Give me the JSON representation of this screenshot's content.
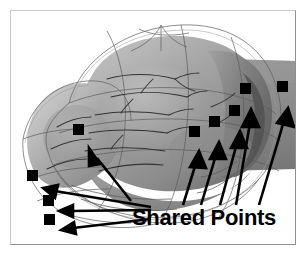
{
  "figure": {
    "kind": "scientific-illustration",
    "background_color": "#ffffff",
    "frame_color": "#c9c9c9",
    "frame_shadow_color": "#8f8f8f",
    "annotation_color": "#000000",
    "surface_colors": {
      "organ_light": "#b9b9b9",
      "organ_mid": "#9a9a9a",
      "organ_dark": "#7c7c7c",
      "organ_darkest": "#5d5d5d",
      "mesh_wireframe": "#4a4a4a",
      "mesh_outline": "#8a8a8a",
      "vessel": "#3c3c3c"
    },
    "caption": {
      "shared_points_label": "Shared Points"
    },
    "markers": {
      "count": 8,
      "shape": "filled-square",
      "color": "#000000",
      "size_px": 11,
      "points": [
        {
          "id": "shared-point-1",
          "x": 27,
          "y": 175
        },
        {
          "id": "shared-point-2",
          "x": 43,
          "y": 200
        },
        {
          "id": "shared-point-3",
          "x": 44,
          "y": 219
        },
        {
          "id": "shared-point-4",
          "x": 73,
          "y": 129
        },
        {
          "id": "shared-point-5",
          "x": 189,
          "y": 131
        },
        {
          "id": "shared-point-6",
          "x": 209,
          "y": 121
        },
        {
          "id": "shared-point-7",
          "x": 229,
          "y": 110
        },
        {
          "id": "shared-point-8",
          "x": 240,
          "y": 88
        },
        {
          "id": "shared-point-9",
          "x": 277,
          "y": 86
        }
      ]
    },
    "arrows": {
      "count": 9,
      "color": "#000000",
      "head": "solid-triangle",
      "lines": [
        {
          "id": "arrow-to-point-1",
          "x1": 150,
          "y1": 205,
          "x2": 38,
          "y2": 179
        },
        {
          "id": "arrow-to-point-2",
          "x1": 150,
          "y1": 207,
          "x2": 53,
          "y2": 203
        },
        {
          "id": "arrow-to-point-3",
          "x1": 150,
          "y1": 213,
          "x2": 55,
          "y2": 221
        },
        {
          "id": "arrow-to-point-4",
          "x1": 126,
          "y1": 196,
          "x2": 82,
          "y2": 140
        },
        {
          "id": "arrow-to-point-5",
          "x1": 182,
          "y1": 196,
          "x2": 190,
          "y2": 142
        },
        {
          "id": "arrow-to-point-6",
          "x1": 200,
          "y1": 196,
          "x2": 210,
          "y2": 133
        },
        {
          "id": "arrow-to-point-7",
          "x1": 219,
          "y1": 196,
          "x2": 231,
          "y2": 121
        },
        {
          "id": "arrow-to-point-8",
          "x1": 235,
          "y1": 196,
          "x2": 242,
          "y2": 100
        },
        {
          "id": "arrow-to-point-9",
          "x1": 258,
          "y1": 196,
          "x2": 279,
          "y2": 98
        }
      ]
    }
  }
}
